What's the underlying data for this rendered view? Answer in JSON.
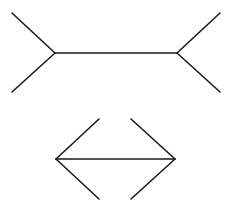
{
  "diagram": {
    "title": "",
    "stroke_color": "#1a1a1a",
    "background": "#ffffff",
    "figures": [
      {
        "name": "fins-out",
        "shaft": {
          "x1": 55,
          "y1": 53,
          "x2": 177,
          "y2": 53
        },
        "fins": [
          {
            "x1": 55,
            "y1": 53,
            "x2": 12,
            "y2": 13
          },
          {
            "x1": 55,
            "y1": 53,
            "x2": 12,
            "y2": 92
          },
          {
            "x1": 177,
            "y1": 53,
            "x2": 220,
            "y2": 13
          },
          {
            "x1": 177,
            "y1": 53,
            "x2": 220,
            "y2": 92
          }
        ]
      },
      {
        "name": "fins-in",
        "shaft": {
          "x1": 56,
          "y1": 159,
          "x2": 175,
          "y2": 159
        },
        "fins": [
          {
            "x1": 56,
            "y1": 159,
            "x2": 99,
            "y2": 119
          },
          {
            "x1": 56,
            "y1": 159,
            "x2": 99,
            "y2": 199
          },
          {
            "x1": 175,
            "y1": 159,
            "x2": 131,
            "y2": 119
          },
          {
            "x1": 175,
            "y1": 159,
            "x2": 131,
            "y2": 199
          }
        ]
      }
    ]
  }
}
